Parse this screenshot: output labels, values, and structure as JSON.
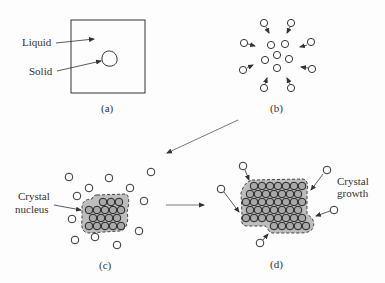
{
  "panels": {
    "a": {
      "caption": "(a)",
      "labels": {
        "liquid": "Liquid",
        "solid": "Solid"
      }
    },
    "b": {
      "caption": "(b)"
    },
    "c": {
      "caption": "(c)",
      "label_line1": "Crystal",
      "label_line2": "nucleus"
    },
    "d": {
      "caption": "(d)",
      "label_line1": "Crystal",
      "label_line2": "growth"
    }
  },
  "colors": {
    "stroke": "#333333",
    "atom_fill": "#ffffff",
    "crystal_fill": "#b8b8b8",
    "atom_in_crystal_fill": "#a9a9a9"
  }
}
